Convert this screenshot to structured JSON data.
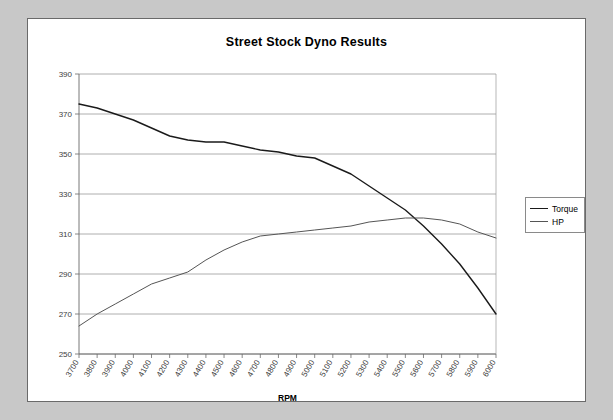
{
  "window": {
    "background_color": "#c8c8c8",
    "panel_color": "#ffffff",
    "border_color": "#6a6a6a"
  },
  "chart_data": {
    "type": "line",
    "title": "Street Stock Dyno Results",
    "xlabel": "RPM",
    "ylabel": "",
    "xlim": [
      3700,
      6000
    ],
    "ylim": [
      250,
      390
    ],
    "ytick_step": 20,
    "xtick_step": 100,
    "grid": true,
    "grid_color": "#9a9a9a",
    "legend_position": "right",
    "categories": [
      3700,
      3800,
      3900,
      4000,
      4100,
      4200,
      4300,
      4400,
      4500,
      4600,
      4700,
      4800,
      4900,
      5000,
      5100,
      5200,
      5300,
      5400,
      5500,
      5600,
      5700,
      5800,
      5900,
      6000
    ],
    "yticks": [
      250,
      270,
      290,
      310,
      330,
      350,
      370,
      390
    ],
    "xticks": [
      "3700",
      "3800",
      "3900",
      "4000",
      "4100",
      "4200",
      "4300",
      "4400",
      "4500",
      "4600",
      "4700",
      "4800",
      "4900",
      "5000",
      "5100",
      "5200",
      "5300",
      "5400",
      "5500",
      "5600",
      "5700",
      "5800",
      "5900",
      "6000"
    ],
    "series": [
      {
        "name": "Torque",
        "color": "#1a1a1a",
        "width": 1.4,
        "values": [
          375,
          373,
          370,
          367,
          363,
          359,
          357,
          356,
          356,
          354,
          352,
          351,
          349,
          348,
          344,
          340,
          334,
          328,
          322,
          314,
          305,
          295,
          283,
          270
        ]
      },
      {
        "name": "HP",
        "color": "#555555",
        "width": 1.0,
        "values": [
          264,
          270,
          275,
          280,
          285,
          288,
          291,
          297,
          302,
          306,
          309,
          310,
          311,
          312,
          313,
          314,
          316,
          317,
          318,
          318,
          317,
          315,
          311,
          308
        ]
      }
    ]
  },
  "legend": {
    "items": [
      {
        "label": "Torque",
        "color": "#1a1a1a"
      },
      {
        "label": "HP",
        "color": "#555555"
      }
    ]
  }
}
